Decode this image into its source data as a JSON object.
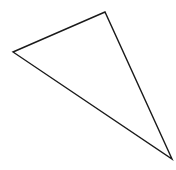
{
  "diagram": {
    "type": "triangle",
    "background": "#ffffff",
    "stroke": "#1a1a1a",
    "stroke_width": 1.4,
    "fill": "none",
    "vertices": [
      {
        "name": "top",
        "x": 105,
        "y": 12
      },
      {
        "name": "left",
        "x": 13,
        "y": 52
      },
      {
        "name": "bottom-right",
        "x": 172,
        "y": 159
      }
    ]
  }
}
